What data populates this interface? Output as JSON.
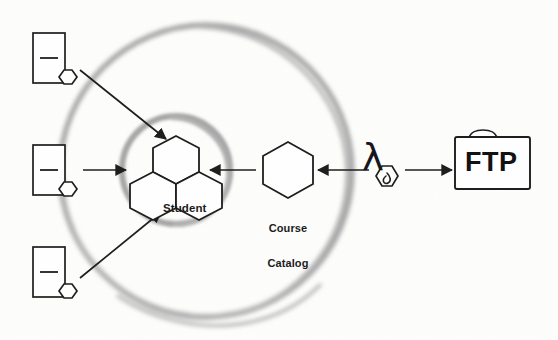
{
  "diagram": {
    "background_color": "#fdfdfc",
    "stroke_color": "#1d1d1d",
    "ring_color": "#a8a8a8",
    "boundaries": [
      {
        "name": "outer-boundary-ring",
        "shape": "circle",
        "cx": 206,
        "cy": 171,
        "r": 146,
        "color": "#a9a9a9",
        "style": "hand-drawn-blurred"
      },
      {
        "name": "inner-boundary-ring",
        "shape": "circle",
        "cx": 176,
        "cy": 170,
        "r": 54,
        "color": "#a9a9a9",
        "style": "hand-drawn-blurred"
      }
    ],
    "source_nodes": [
      {
        "id": "source-1",
        "label": "",
        "x": 33,
        "y": 33,
        "w": 32,
        "h": 50,
        "icon": "document-node-icon"
      },
      {
        "id": "source-2",
        "label": "",
        "x": 33,
        "y": 145,
        "w": 32,
        "h": 50,
        "icon": "document-node-icon"
      },
      {
        "id": "source-3",
        "label": "",
        "x": 33,
        "y": 247,
        "w": 32,
        "h": 50,
        "icon": "document-node-icon"
      }
    ],
    "entities": [
      {
        "id": "student",
        "label": "Student",
        "label_x": 162,
        "label_y": 208,
        "icon": "hexagon-cluster-icon"
      },
      {
        "id": "course-catalog",
        "label": "Course\nCatalog",
        "label_line1": "Course",
        "label_line2": "Catalog",
        "label_x": 263,
        "label_y": 197,
        "icon": "hexagon-icon"
      },
      {
        "id": "lambda-transform",
        "label": "λ",
        "label_x": 377,
        "label_y": 148,
        "icon": "lambda-hexagon-icon"
      },
      {
        "id": "ftp",
        "label": "FTP",
        "label_x": 470,
        "label_y": 152,
        "icon": "folder-icon"
      }
    ],
    "edges": [
      {
        "id": "edge-source1-student",
        "from": "source-1",
        "to": "student",
        "style": "diagonal-arrow",
        "direction": "down-right"
      },
      {
        "id": "edge-source2-student",
        "from": "source-2",
        "to": "student",
        "style": "straight-arrow",
        "direction": "right"
      },
      {
        "id": "edge-source3-student",
        "from": "source-3",
        "to": "student",
        "style": "diagonal-arrow",
        "direction": "up-right"
      },
      {
        "id": "edge-catalog-student",
        "from": "course-catalog",
        "to": "student",
        "style": "straight-arrow",
        "direction": "left"
      },
      {
        "id": "edge-lambda-catalog",
        "from": "lambda-transform",
        "to": "course-catalog",
        "style": "straight-arrow",
        "direction": "left"
      },
      {
        "id": "edge-lambda-ftp",
        "from": "lambda-transform",
        "to": "ftp",
        "style": "straight-arrow",
        "direction": "right"
      }
    ]
  }
}
